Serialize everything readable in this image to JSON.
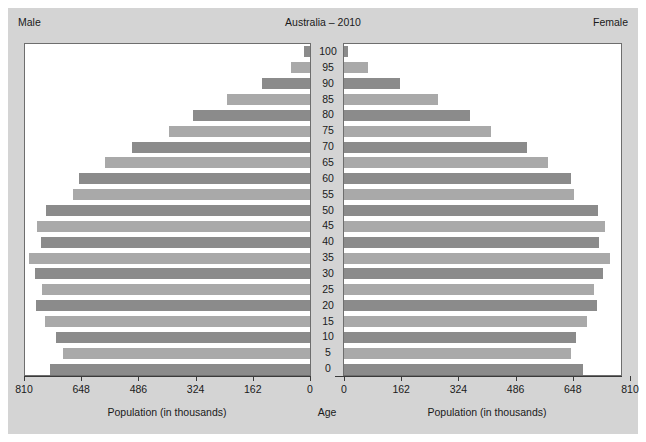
{
  "header": {
    "left_label": "Male",
    "title": "Australia – 2010",
    "right_label": "Female"
  },
  "axis": {
    "left_caption": "Population (in thousands)",
    "center_caption": "Age",
    "right_caption": "Population (in thousands)",
    "left_ticks": [
      "810",
      "648",
      "486",
      "324",
      "162",
      "0"
    ],
    "right_ticks": [
      "0",
      "162",
      "324",
      "486",
      "648",
      "810"
    ]
  },
  "colors": {
    "figure_background": "#d4d4d4",
    "panel_background": "#ffffff",
    "bar_dark": "#8b8b8b",
    "bar_light": "#a9a9a9",
    "axis_line": "#3a3a3a",
    "text": "#1a1a1a"
  },
  "chart_data": {
    "type": "bar",
    "title": "Australia – 2010",
    "subtitle": "",
    "xlabel": "Population (in thousands)",
    "ylabel": "Age",
    "xlim": [
      0,
      810
    ],
    "grid": false,
    "legend_position": "top-corners",
    "categories": [
      "0",
      "5",
      "10",
      "15",
      "20",
      "25",
      "30",
      "35",
      "40",
      "45",
      "50",
      "55",
      "60",
      "65",
      "70",
      "75",
      "80",
      "85",
      "90",
      "95",
      "100"
    ],
    "series": [
      {
        "name": "Male",
        "direction": "left",
        "values": [
          737,
          700,
          718,
          750,
          775,
          760,
          778,
          795,
          762,
          772,
          748,
          670,
          655,
          580,
          505,
          400,
          330,
          235,
          135,
          55,
          16
        ]
      },
      {
        "name": "Female",
        "direction": "right",
        "values": [
          700,
          665,
          680,
          710,
          740,
          730,
          757,
          775,
          745,
          762,
          742,
          675,
          665,
          600,
          540,
          440,
          380,
          290,
          182,
          90,
          35
        ]
      }
    ]
  }
}
